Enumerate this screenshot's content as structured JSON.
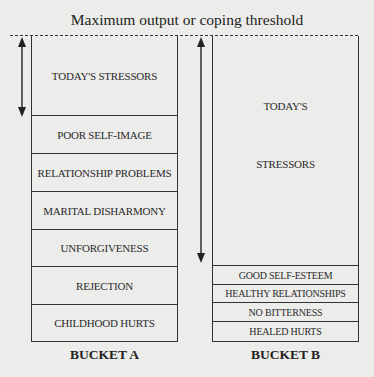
{
  "title": "Maximum output or coping threshold",
  "bucket_a": {
    "label": "BUCKET A",
    "segments": [
      "TODAY'S STRESSORS",
      "POOR SELF-IMAGE",
      "RELATIONSHIP PROBLEMS",
      "MARITAL DISHARMONY",
      "UNFORGIVENESS",
      "REJECTION",
      "CHILDHOOD HURTS"
    ]
  },
  "bucket_b": {
    "label": "BUCKET B",
    "stressors_line1": "TODAY'S",
    "stressors_line2": "STRESSORS",
    "segments": [
      "GOOD SELF-ESTEEM",
      "HEALTHY RELATIONSHIPS",
      "NO BITTERNESS",
      "HEALED HURTS"
    ]
  },
  "arrows": {
    "a": "double-headed arrow spanning today's stressors (small capacity)",
    "b": "double-headed arrow spanning today's stressors (large capacity)"
  }
}
